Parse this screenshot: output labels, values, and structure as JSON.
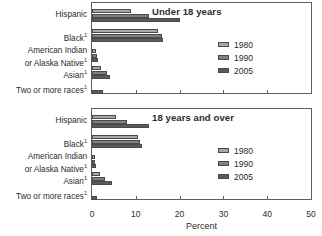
{
  "axis": {
    "xlabel": "Percent",
    "ticks": [
      0,
      10,
      20,
      30,
      40,
      50
    ],
    "tick_labels": [
      "0",
      "10",
      "20",
      "30",
      "40",
      "50"
    ]
  },
  "legend": {
    "position": "right-inside",
    "items": [
      {
        "label": "1980",
        "color": "#a8a8a8"
      },
      {
        "label": "1990",
        "color": "#808080"
      },
      {
        "label": "2005",
        "color": "#5a5a5a"
      }
    ]
  },
  "categories_display": [
    "Hispanic",
    "Black",
    "American Indian<br>or Alaska Native",
    "Asian",
    "Two or more races"
  ],
  "panels": [
    {
      "title": "Under 18 years"
    },
    {
      "title": "18 years and over"
    }
  ],
  "chart_data": {
    "type": "bar",
    "orientation": "horizontal",
    "title": "",
    "xlabel": "Percent",
    "ylabel": "",
    "xlim": [
      0,
      50
    ],
    "grid": false,
    "legend_position": "right-inside",
    "panels": [
      {
        "title": "Under 18 years",
        "categories": [
          "Hispanic",
          "Black",
          "American Indian or Alaska Native",
          "Asian",
          "Two or more races"
        ],
        "series": [
          {
            "name": "1980",
            "color": "#a8a8a8",
            "values": [
              9.0,
              15.0,
              1.0,
              2.0,
              0.0
            ]
          },
          {
            "name": "1990",
            "color": "#808080",
            "values": [
              13.0,
              16.0,
              1.1,
              3.5,
              0.0
            ]
          },
          {
            "name": "2005",
            "color": "#5a5a5a",
            "values": [
              20.0,
              16.3,
              1.4,
              4.2,
              2.5
            ]
          }
        ]
      },
      {
        "title": "18 years and over",
        "categories": [
          "Hispanic",
          "Black",
          "American Indian or Alaska Native",
          "Asian",
          "Two or more races"
        ],
        "series": [
          {
            "name": "1980",
            "color": "#a8a8a8",
            "values": [
              5.5,
              10.5,
              0.6,
              1.8,
              0.0
            ]
          },
          {
            "name": "1990",
            "color": "#808080",
            "values": [
              8.0,
              11.0,
              0.7,
              3.0,
              0.0
            ]
          },
          {
            "name": "2005",
            "color": "#5a5a5a",
            "values": [
              13.0,
              11.5,
              0.9,
              4.5,
              1.2
            ]
          }
        ]
      }
    ],
    "footnote_marker": "1",
    "footnoted_categories": [
      "Black",
      "American Indian or Alaska Native",
      "Asian",
      "Two or more races"
    ]
  }
}
